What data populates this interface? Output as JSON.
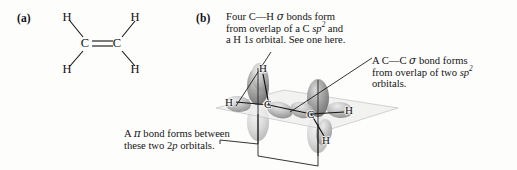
{
  "figure": {
    "panels": {
      "a_label": "(a)",
      "b_label": "(b)"
    }
  },
  "lewis_structure": {
    "name": "ethene-lewis-structure",
    "atoms": {
      "h_top_left": "H",
      "h_top_right": "H",
      "h_bottom_left": "H",
      "h_bottom_right": "H",
      "c_left": "C",
      "c_right": "C"
    },
    "bond_type": "double"
  },
  "annotations": {
    "ch_sigma": {
      "line1_pre": "Four C",
      "line1_dash": "—",
      "line1_h": "H ",
      "line1_sigma": "σ",
      "line1_post": " bonds form",
      "line2_pre": "from overlap of a C ",
      "line2_orbital": "sp",
      "line2_sup": "2",
      "line2_post": " and",
      "line3_pre": "a H 1",
      "line3_orbital": "s",
      "line3_post": " orbital. See one here."
    },
    "cc_sigma": {
      "line1_pre": "A C",
      "line1_dash": "—",
      "line1_c": "C ",
      "line1_sigma": "σ",
      "line1_post": " bond forms",
      "line2_pre": "from overlap of two ",
      "line2_orbital": "sp",
      "line2_sup": "2",
      "line3": "orbitals."
    },
    "pi_bond": {
      "line1_pre": "A ",
      "line1_pi": "π",
      "line1_post": " bond forms between",
      "line2_pre": "these two 2",
      "line2_orbital": "p",
      "line2_post": " orbitals."
    }
  },
  "orbital_model": {
    "name": "ethene-sp2-orbital-model",
    "atom_labels": {
      "h_upper_left_c": "H",
      "h_left": "H",
      "h_right": "H",
      "h_lower_right_c": "H",
      "c_left": "C",
      "c_right": "C"
    },
    "colors": {
      "lobe_dark": "#6e6e6e",
      "lobe_mid": "#9a9a9a",
      "lobe_light": "#c9c9c9",
      "plane": "#ededed",
      "leader_line": "#1a1a1a",
      "bond_line": "#111111"
    }
  }
}
